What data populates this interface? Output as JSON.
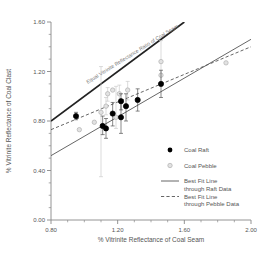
{
  "chart_data": {
    "type": "scatter",
    "title": "",
    "xlabel": "% Vitrinite Reflectance of Coal Seam",
    "ylabel": "% Vitrinite Reflectance of Coal Clast",
    "xlim": [
      0.8,
      2.0
    ],
    "ylim": [
      0.0,
      1.6
    ],
    "xticks": [
      0.8,
      1.2,
      1.6,
      2.0
    ],
    "xtick_labels": [
      "0.80",
      "1.20",
      "1.60",
      "2.00"
    ],
    "yticks": [
      0.0,
      0.4,
      0.8,
      1.2,
      1.6
    ],
    "ytick_labels": [
      "0.00",
      "0.40",
      "0.80",
      "1.20",
      "1.60"
    ],
    "x_minor_step": 0.1,
    "y_minor_step": 0.1,
    "grid": false,
    "legend_position": "lower-right",
    "annotations": [
      {
        "name": "equal-reflectance-line-label",
        "text": "Equal Vitrinite Reflectance Ratio of Coal Seam",
        "rotation": -32
      }
    ],
    "series": [
      {
        "name": "Coal Raft",
        "marker": "filled-circle",
        "color": "#000000",
        "points": [
          {
            "x": 0.95,
            "y": 0.84,
            "yerr_low": 0.81,
            "yerr_high": 0.87
          },
          {
            "x": 1.11,
            "y": 0.76,
            "yerr_low": 0.69,
            "yerr_high": 0.84
          },
          {
            "x": 1.13,
            "y": 0.74,
            "yerr_low": 0.66,
            "yerr_high": 0.82
          },
          {
            "x": 1.17,
            "y": 0.86,
            "yerr_low": 0.76,
            "yerr_high": 0.95
          },
          {
            "x": 1.22,
            "y": 0.83,
            "yerr_low": 0.7,
            "yerr_high": 0.95
          },
          {
            "x": 1.22,
            "y": 0.96,
            "yerr_low": 0.89,
            "yerr_high": 1.02
          },
          {
            "x": 1.25,
            "y": 0.92,
            "yerr_low": 0.8,
            "yerr_high": 1.02
          },
          {
            "x": 1.32,
            "y": 0.97,
            "yerr_low": 0.88,
            "yerr_high": 1.06
          },
          {
            "x": 1.46,
            "y": 1.1,
            "yerr_low": 0.99,
            "yerr_high": 1.21
          }
        ]
      },
      {
        "name": "Coal Pebble",
        "marker": "open-circle",
        "color": "#b9b9b9",
        "points": [
          {
            "x": 0.97,
            "y": 0.73,
            "yerr_low": 0.73,
            "yerr_high": 0.73
          },
          {
            "x": 1.06,
            "y": 0.79,
            "yerr_low": 0.79,
            "yerr_high": 0.79
          },
          {
            "x": 1.1,
            "y": 0.87,
            "yerr_low": 0.35,
            "yerr_high": 1.24
          },
          {
            "x": 1.13,
            "y": 0.92,
            "yerr_low": 0.85,
            "yerr_high": 0.99
          },
          {
            "x": 1.14,
            "y": 1.02,
            "yerr_low": 0.96,
            "yerr_high": 1.07
          },
          {
            "x": 1.17,
            "y": 1.05,
            "yerr_low": 1.05,
            "yerr_high": 1.05
          },
          {
            "x": 1.19,
            "y": 0.83,
            "yerr_low": 0.74,
            "yerr_high": 1.08
          },
          {
            "x": 1.21,
            "y": 1.02,
            "yerr_low": 0.95,
            "yerr_high": 1.09
          },
          {
            "x": 1.26,
            "y": 1.05,
            "yerr_low": 0.97,
            "yerr_high": 1.12
          },
          {
            "x": 1.46,
            "y": 1.28,
            "yerr_low": 1.1,
            "yerr_high": 1.45
          },
          {
            "x": 1.46,
            "y": 1.17,
            "yerr_low": 1.17,
            "yerr_high": 1.17
          },
          {
            "x": 1.85,
            "y": 1.27,
            "yerr_low": 1.27,
            "yerr_high": 1.27
          }
        ]
      }
    ],
    "lines": [
      {
        "name": "equal-reflectance-line",
        "style": "solid-thick",
        "x1": 0.8,
        "y1": 0.8,
        "x2": 1.6,
        "y2": 1.6
      },
      {
        "name": "best-fit-raft",
        "style": "solid",
        "x1": 0.8,
        "y1": 0.52,
        "x2": 2.0,
        "y2": 1.46
      },
      {
        "name": "best-fit-pebble",
        "style": "dashed",
        "x1": 0.8,
        "y1": 0.73,
        "x2": 2.0,
        "y2": 1.4
      }
    ],
    "legend": [
      {
        "label": "Coal Raft",
        "marker": "filled-circle",
        "color": "#000000"
      },
      {
        "label": "Coal Pebble",
        "marker": "open-circle",
        "color": "#b9b9b9"
      },
      {
        "label": "Best Fit Line\nthrough Raft Data",
        "marker": "solid-line",
        "color": "#555555"
      },
      {
        "label": "Best Fit Line\nthrough Pebble Data",
        "marker": "dashed-line",
        "color": "#555555"
      }
    ],
    "legend_entries": [
      {
        "line1": "Coal Raft",
        "line2": ""
      },
      {
        "line1": "Coal Pebble",
        "line2": ""
      },
      {
        "line1": "Best Fit Line",
        "line2": "through Raft Data"
      },
      {
        "line1": "Best Fit Line",
        "line2": "through Pebble Data"
      }
    ]
  },
  "colors": {
    "axis": "#888888",
    "text": "#555555",
    "raft": "#000000",
    "pebble": "#b9b9b9",
    "fitline": "#555555",
    "equalline": "#222222",
    "background": "#ffffff"
  }
}
